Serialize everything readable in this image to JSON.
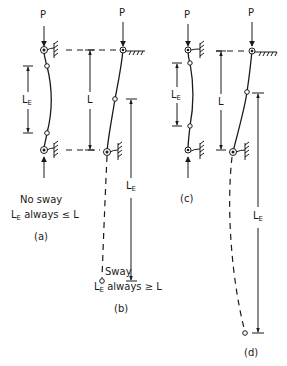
{
  "figure": {
    "load_label": "P",
    "length_label": "L",
    "effective_length": {
      "main": "L",
      "sub": "E"
    },
    "panels": [
      {
        "id": "a",
        "caption": "(a)",
        "note_line1": "No sway",
        "note_line2_suffix": "always ≤ L",
        "mode": "no-sway, fixed-fixed"
      },
      {
        "id": "b",
        "caption": "(b)",
        "note_line1": "Sway",
        "note_line2_suffix": "always ≥ L",
        "mode": "sway, fixed-fixed"
      },
      {
        "id": "c",
        "caption": "(c)",
        "mode": "no-sway"
      },
      {
        "id": "d",
        "caption": "(d)",
        "mode": "sway"
      }
    ]
  }
}
